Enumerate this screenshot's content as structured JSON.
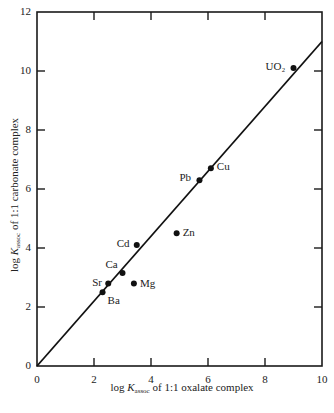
{
  "chart_data": {
    "type": "scatter",
    "title": "",
    "xlabel": "log K_assoc of 1:1 oxalate complex",
    "ylabel": "log K_assoc of 1:1 carbonate complex",
    "xlabel_parts": {
      "pre": "log ",
      "k": "K",
      "sub": "assoc",
      "post": " of 1:1 oxalate complex"
    },
    "ylabel_parts": {
      "pre": "log ",
      "k": "K",
      "sub": "assoc",
      "post": " of 1:1 carbonate complex"
    },
    "xlim": [
      0,
      10
    ],
    "ylim": [
      0,
      12
    ],
    "x_ticks": [
      "0",
      "2",
      "4",
      "6",
      "8",
      "10"
    ],
    "y_ticks": [
      "0",
      "2",
      "4",
      "6",
      "8",
      "10",
      "12"
    ],
    "grid": false,
    "legend": null,
    "points": [
      {
        "label": "UO₂",
        "x": 9.0,
        "y": 10.1
      },
      {
        "label": "Cu",
        "x": 6.1,
        "y": 6.7
      },
      {
        "label": "Pb",
        "x": 5.7,
        "y": 6.3
      },
      {
        "label": "Zn",
        "x": 4.9,
        "y": 4.5
      },
      {
        "label": "Cd",
        "x": 3.5,
        "y": 4.1
      },
      {
        "label": "Ca",
        "x": 3.0,
        "y": 3.15
      },
      {
        "label": "Sr",
        "x": 2.5,
        "y": 2.8
      },
      {
        "label": "Mg",
        "x": 3.4,
        "y": 2.8
      },
      {
        "label": "Ba",
        "x": 2.3,
        "y": 2.5
      }
    ],
    "fit_line": {
      "x": [
        0,
        10
      ],
      "y": [
        0,
        11
      ]
    }
  }
}
